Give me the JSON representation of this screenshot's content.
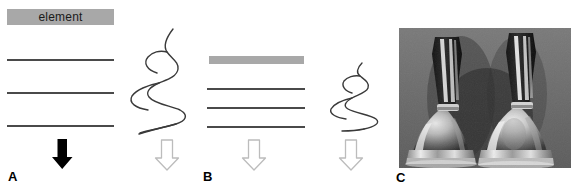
{
  "figure": {
    "width": 574,
    "height": 191,
    "background": "#ffffff",
    "type": "scientific-figure-three-panel",
    "colors": {
      "gray_bar": "#a8a8a8",
      "line": "#4a4a4a",
      "black_arrow": "#000000",
      "hollow_arrow_stroke": "#b4b4b4",
      "hollow_arrow_fill": "#ffffff",
      "squiggle": "#3a3a3a",
      "photo_background": "#6e6e6e"
    }
  },
  "panels": [
    {
      "id": "A",
      "label": "A",
      "label_x": 8,
      "label_y": 170,
      "bar": {
        "name": "element-bar",
        "text": "element",
        "x": 7,
        "y": 9,
        "width": 107,
        "height": 16
      },
      "lines": [
        {
          "x": 7,
          "y": 59,
          "width": 107
        },
        {
          "x": 7,
          "y": 92,
          "width": 107
        },
        {
          "x": 7,
          "y": 125,
          "width": 107
        }
      ],
      "arrow": {
        "type": "solid-black-down-arrow",
        "x": 62,
        "y_top": 139,
        "y_bottom": 169,
        "shaft_width": 9,
        "head_width": 20
      }
    },
    {
      "id": "B",
      "label": "B",
      "label_x": 203,
      "label_y": 170,
      "bar": {
        "name": "plain-gray-bar",
        "text": "",
        "x": 209,
        "y": 56,
        "width": 95,
        "height": 8
      },
      "lines": [
        {
          "x": 207,
          "y": 88,
          "width": 98
        },
        {
          "x": 207,
          "y": 107,
          "width": 98
        },
        {
          "x": 207,
          "y": 126,
          "width": 98
        }
      ],
      "arrow": {
        "type": "hollow-outline-down-arrow",
        "x": 254,
        "y_top": 140,
        "y_bottom": 170,
        "shaft_width": 11,
        "head_width": 22
      }
    },
    {
      "id": "C",
      "label": "C",
      "label_x": 396,
      "label_y": 171,
      "photo": {
        "name": "handbells-photograph",
        "description": "grayscale photograph of two handbells with dark leather handles and polished metal bells",
        "x": 399,
        "y": 28,
        "width": 172,
        "height": 140,
        "subject_count": 2
      }
    }
  ],
  "squiggles": [
    {
      "name": "large-vibration-wave",
      "x": 128,
      "y": 28,
      "width": 70,
      "height": 108,
      "amplitude": "increasing-downward",
      "cycles": 4
    },
    {
      "name": "small-vibration-wave",
      "x": 330,
      "y": 62,
      "width": 56,
      "height": 70,
      "amplitude": "increasing-downward",
      "cycles": 3
    }
  ],
  "hollow_arrows": [
    {
      "name": "hollow-arrow-1",
      "x": 167,
      "y_top": 140,
      "y_bottom": 170
    },
    {
      "name": "hollow-arrow-2",
      "x": 254,
      "y_top": 140,
      "y_bottom": 170
    },
    {
      "name": "hollow-arrow-3",
      "x": 351,
      "y_top": 140,
      "y_bottom": 170
    }
  ]
}
